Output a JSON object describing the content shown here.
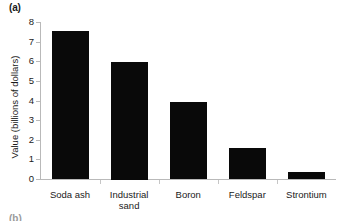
{
  "figure": {
    "panel_label": "(a)",
    "next_panel_label": "(b)",
    "background_color": "#ffffff",
    "bar_color": "#090909",
    "axis_color": "#b9b9b9"
  },
  "chart_data": {
    "type": "bar",
    "title": "",
    "subtitle": "",
    "xlabel": "",
    "ylabel": "Value (billions of dollars)",
    "categories": [
      "Soda ash",
      "Industrial sand",
      "Boron",
      "Feldspar",
      "Strontium"
    ],
    "category_label_lines": [
      [
        "Soda ash"
      ],
      [
        "Industrial",
        "sand"
      ],
      [
        "Boron"
      ],
      [
        "Feldspar"
      ],
      [
        "Strontium"
      ]
    ],
    "values": [
      7.55,
      6.0,
      3.95,
      1.6,
      0.4
    ],
    "ylim": [
      0,
      8
    ],
    "ytick_step": 1,
    "ytick_labels": [
      "0",
      "1",
      "2",
      "3",
      "4",
      "5",
      "6",
      "7",
      "8"
    ],
    "grid": false,
    "legend": false,
    "legend_position": "none",
    "series": [
      {
        "name": "Value",
        "values": [
          7.55,
          6.0,
          3.95,
          1.6,
          0.4
        ]
      }
    ]
  }
}
